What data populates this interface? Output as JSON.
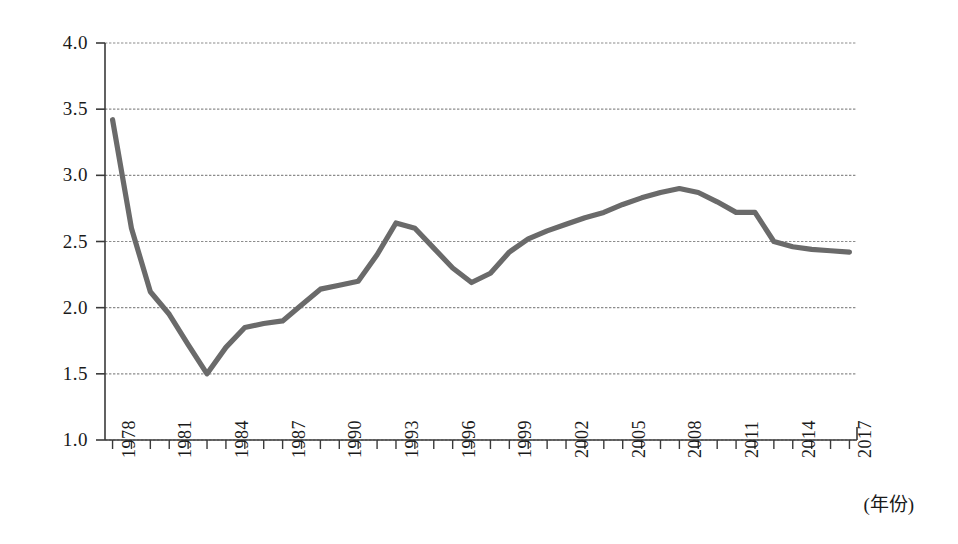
{
  "chart_data": {
    "type": "line",
    "title": "",
    "subtitle": "",
    "xlabel": "(年份)",
    "ylabel": "",
    "xlim": [
      1977.6,
      2017.4
    ],
    "ylim": [
      1.0,
      4.0
    ],
    "grid": true,
    "legend": null,
    "legend_position": "none",
    "line_color": "#6a6a6a",
    "grid_color": "#8c8c8c",
    "axis_color": "#3a3a3a",
    "y_ticks": [
      "1.0",
      "1.5",
      "2.0",
      "2.5",
      "3.0",
      "3.5",
      "4.0"
    ],
    "y_tick_values": [
      1.0,
      1.5,
      2.0,
      2.5,
      3.0,
      3.5,
      4.0
    ],
    "x_tick_labels": [
      "1978",
      "1981",
      "1984",
      "1987",
      "1990",
      "1993",
      "1996",
      "1999",
      "2002",
      "2005",
      "2008",
      "2011",
      "2014",
      "2017"
    ],
    "x_tick_values": [
      1978,
      1981,
      1984,
      1987,
      1990,
      1993,
      1996,
      1999,
      2002,
      2005,
      2008,
      2011,
      2014,
      2017
    ],
    "x": [
      1978,
      1979,
      1980,
      1981,
      1982,
      1983,
      1984,
      1985,
      1986,
      1987,
      1988,
      1989,
      1990,
      1991,
      1992,
      1993,
      1994,
      1995,
      1996,
      1997,
      1998,
      1999,
      2000,
      2001,
      2002,
      2003,
      2004,
      2005,
      2006,
      2007,
      2008,
      2009,
      2010,
      2011,
      2012,
      2013,
      2014,
      2015,
      2016,
      2017
    ],
    "values": [
      3.42,
      2.6,
      2.12,
      1.95,
      1.72,
      1.5,
      1.7,
      1.85,
      1.88,
      1.9,
      2.02,
      2.14,
      2.17,
      2.2,
      2.4,
      2.64,
      2.6,
      2.45,
      2.3,
      2.19,
      2.26,
      2.42,
      2.52,
      2.58,
      2.63,
      2.68,
      2.72,
      2.78,
      2.83,
      2.87,
      2.9,
      2.87,
      2.8,
      2.72,
      2.72,
      2.5,
      2.46,
      2.44,
      2.43,
      2.42
    ],
    "series": [
      {
        "name": "series-1",
        "values": [
          3.42,
          2.6,
          2.12,
          1.95,
          1.72,
          1.5,
          1.7,
          1.85,
          1.88,
          1.9,
          2.02,
          2.14,
          2.17,
          2.2,
          2.4,
          2.64,
          2.6,
          2.45,
          2.3,
          2.19,
          2.26,
          2.42,
          2.52,
          2.58,
          2.63,
          2.68,
          2.72,
          2.78,
          2.83,
          2.87,
          2.9,
          2.87,
          2.8,
          2.72,
          2.72,
          2.5,
          2.46,
          2.44,
          2.43,
          2.42
        ]
      }
    ]
  }
}
